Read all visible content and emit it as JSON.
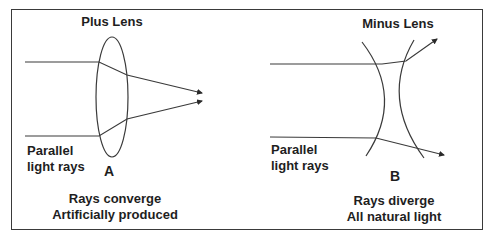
{
  "diagram": {
    "colors": {
      "line": "#3a3a3a",
      "text": "#1e1e1e",
      "background": "#ffffff"
    },
    "panels": [
      {
        "id": "plus",
        "title": "Plus Lens",
        "letter": "A",
        "rays_label": [
          "Parallel",
          "light rays"
        ],
        "caption": [
          "Rays converge",
          "Artificially produced"
        ],
        "lens_shape": "biconvex ellipse",
        "ray_behavior": "converge"
      },
      {
        "id": "minus",
        "title": "Minus Lens",
        "letter": "B",
        "rays_label": [
          "Parallel",
          "light rays"
        ],
        "caption": [
          "Rays diverge",
          "All natural light"
        ],
        "lens_shape": "biconcave",
        "ray_behavior": "diverge"
      }
    ]
  }
}
